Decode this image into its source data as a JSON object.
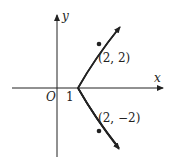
{
  "diagram": {
    "curve": "parabola x = 1 + y^2/4",
    "axes": {
      "x_label": "x",
      "y_label": "y",
      "origin_label": "O"
    },
    "vertex_label": "1",
    "points": [
      {
        "label": "(2, 2)",
        "x": 2,
        "y": 2
      },
      {
        "label": "(2, −2)",
        "x": 2,
        "y": -2
      }
    ],
    "colors": {
      "stroke": "#222222",
      "background": "#ffffff"
    }
  }
}
